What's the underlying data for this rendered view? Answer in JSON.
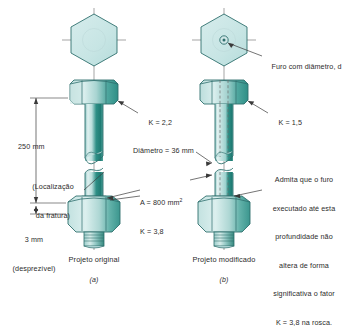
{
  "figure": {
    "colors": {
      "outline": "#2f6f6d",
      "metal_light": "#cfe6e6",
      "metal_mid": "#a9d2d2",
      "metal_dark": "#2f8d86",
      "metal_shade": "#7cbcbb",
      "text": "#2b2b2b",
      "leader": "#3a3a3a"
    },
    "panels": [
      {
        "id": "a",
        "caption": "Projeto original",
        "sublabel": "(a)",
        "annotations": [
          {
            "name": "k-factor-head",
            "text": "K = 2,2"
          },
          {
            "name": "overall-length",
            "text": "250 mm"
          },
          {
            "name": "fracture-location",
            "text": "(Localização\nda fratura)"
          },
          {
            "name": "thread-length",
            "text": "3 mm\n(desprezível)"
          },
          {
            "name": "area-and-k",
            "text": "A = 800 mm²\nK = 3,8"
          }
        ]
      },
      {
        "id": "b",
        "caption": "Projeto modificado",
        "sublabel": "(b)",
        "annotations": [
          {
            "name": "hole-diameter",
            "text": "Furo com diâmetro, d"
          },
          {
            "name": "k-factor-head",
            "text": "K = 1,5"
          },
          {
            "name": "shaft-diameter",
            "text": "Diâmetro = 36 mm"
          },
          {
            "name": "hole-depth-note",
            "text": "Admita que o furo\nexecutado até esta\nprofundidade não\naltera de forma\nsignificativa o fator\nK = 3,8 na rosca."
          }
        ]
      }
    ],
    "labels": {
      "k_head_a": "K = 2,2",
      "k_head_b": "K = 1,5",
      "length_250": "250 mm",
      "fracture_line1": "(Localização",
      "fracture_line2": "da fratura)",
      "thread_line1": "3 mm",
      "thread_line2": "(desprezível)",
      "area_line": "A = 800 mm",
      "area_sup": "2",
      "k_thread": "K = 3,8",
      "diameter_36": "Diâmetro = 36 mm",
      "hole_diam": "Furo com diâmetro, ",
      "hole_diam_sym": "d",
      "note_l1": "Admita que o furo",
      "note_l2": "executado até esta",
      "note_l3": "profundidade não",
      "note_l4": "altera de forma",
      "note_l5": "significativa o fator",
      "note_l6": "K = 3,8 na rosca.",
      "caption_a": "Projeto original",
      "caption_b": "Projeto modificado",
      "sub_a": "(a)",
      "sub_b": "(b)"
    }
  }
}
